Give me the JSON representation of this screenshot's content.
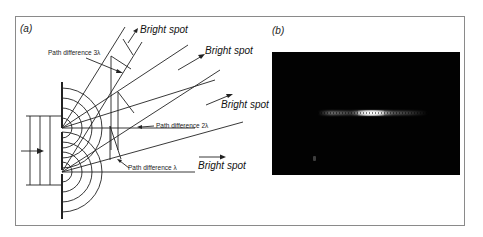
{
  "figure": {
    "panel_a": {
      "label": "(a)",
      "bright_spots": [
        "Bright spot",
        "Bright spot",
        "Bright spot",
        "Bright spot"
      ],
      "path_differences": [
        "Path difference 3λ",
        "Path difference 2λ",
        "Path difference λ"
      ]
    },
    "panel_b": {
      "label": "(b)",
      "description": "Photograph of double-slit interference fringes on black background"
    }
  }
}
